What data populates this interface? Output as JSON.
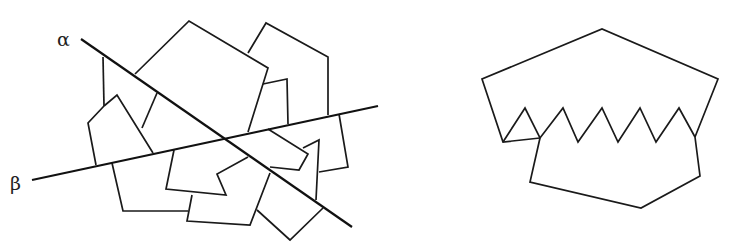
{
  "figure": {
    "left_panel": {
      "lines": [
        {
          "label": "α",
          "from": [
            81,
            39
          ],
          "to": [
            352,
            227
          ],
          "label_pos": [
            57,
            28
          ]
        },
        {
          "label": "β",
          "from": [
            32,
            180
          ],
          "to": [
            378,
            106
          ],
          "label_pos": [
            10,
            172
          ]
        }
      ],
      "polylines": [
        [
          [
            135,
            74
          ],
          [
            189,
            21
          ],
          [
            268,
            68
          ],
          [
            248,
            132
          ]
        ],
        [
          [
            157,
            93
          ],
          [
            142,
            128
          ]
        ],
        [
          [
            103,
            57
          ],
          [
            104,
            106
          ]
        ],
        [
          [
            248,
            53
          ],
          [
            266,
            23
          ],
          [
            328,
            57
          ],
          [
            328,
            115
          ]
        ],
        [
          [
            263,
            84
          ],
          [
            287,
            79
          ],
          [
            288,
            124
          ]
        ],
        [
          [
            104,
            106
          ],
          [
            117,
            95
          ],
          [
            153,
            153
          ]
        ],
        [
          [
            104,
            106
          ],
          [
            88,
            123
          ],
          [
            96,
            165
          ]
        ],
        [
          [
            112,
            163
          ],
          [
            123,
            211
          ],
          [
            188,
            211
          ]
        ],
        [
          [
            174,
            150
          ],
          [
            166,
            189
          ],
          [
            226,
            195
          ],
          [
            217,
            174
          ],
          [
            248,
            157
          ]
        ],
        [
          [
            192,
            195
          ],
          [
            187,
            221
          ],
          [
            250,
            225
          ],
          [
            270,
            173
          ]
        ],
        [
          [
            257,
            210
          ],
          [
            290,
            240
          ],
          [
            323,
            208
          ]
        ],
        [
          [
            268,
            129
          ],
          [
            308,
            154
          ],
          [
            299,
            170
          ],
          [
            270,
            167
          ]
        ],
        [
          [
            303,
            148
          ],
          [
            319,
            140
          ],
          [
            316,
            200
          ]
        ],
        [
          [
            339,
            114
          ],
          [
            348,
            167
          ],
          [
            319,
            172
          ]
        ]
      ]
    },
    "right_panel": {
      "polylines": [
        [
          [
            540,
            138
          ],
          [
            503,
            142
          ],
          [
            482,
            79
          ],
          [
            602,
            29
          ],
          [
            718,
            79
          ],
          [
            695,
            137
          ]
        ],
        [
          [
            503,
            142
          ],
          [
            525,
            108
          ],
          [
            540,
            138
          ],
          [
            563,
            108
          ],
          [
            578,
            142
          ],
          [
            602,
            108
          ],
          [
            618,
            142
          ],
          [
            640,
            108
          ],
          [
            656,
            142
          ],
          [
            679,
            108
          ],
          [
            695,
            137
          ]
        ],
        [
          [
            540,
            138
          ],
          [
            530,
            182
          ],
          [
            641,
            208
          ],
          [
            700,
            176
          ],
          [
            695,
            137
          ]
        ]
      ]
    }
  },
  "labels": {
    "alpha": "α",
    "beta": "β"
  }
}
